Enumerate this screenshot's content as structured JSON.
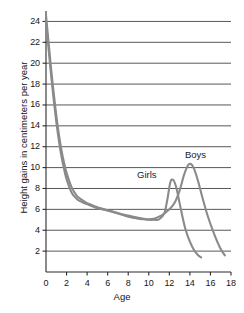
{
  "chart_data": {
    "type": "line",
    "title": "",
    "xlabel": "Age",
    "ylabel": "Height gains in centimeters per year",
    "xlim": [
      0,
      18
    ],
    "ylim": [
      0,
      25
    ],
    "xticks": [
      0,
      2,
      4,
      6,
      8,
      10,
      12,
      14,
      16,
      18
    ],
    "yticks": [
      2,
      4,
      6,
      8,
      10,
      12,
      14,
      16,
      18,
      20,
      22,
      24
    ],
    "grid": "horizontal",
    "legend_position": "inline-annotations",
    "annotations": [
      {
        "text": "Girls",
        "x": 10.6,
        "y": 9.4
      },
      {
        "text": "Boys",
        "x": 14.6,
        "y": 11.5
      }
    ],
    "series": [
      {
        "name": "Girls",
        "color": "#8a8a8a",
        "x": [
          0,
          0.25,
          0.5,
          0.75,
          1,
          1.25,
          1.5,
          1.75,
          2,
          2.5,
          3,
          3.5,
          4,
          4.5,
          5,
          5.5,
          6,
          6.5,
          7,
          7.5,
          8,
          8.5,
          9,
          9.5,
          10,
          10.5,
          11,
          11.5,
          11.8,
          12.1,
          12.4,
          12.7,
          13,
          13.3,
          13.6,
          14,
          14.4,
          14.8,
          15.1
        ],
        "y": [
          24.0,
          21.4,
          18.8,
          16.5,
          14.4,
          12.6,
          11.1,
          9.9,
          8.9,
          7.6,
          7.0,
          6.7,
          6.5,
          6.3,
          6.1,
          6.0,
          5.9,
          5.75,
          5.6,
          5.45,
          5.3,
          5.2,
          5.1,
          5.05,
          5.0,
          5.0,
          5.05,
          5.6,
          6.9,
          8.6,
          8.8,
          8.0,
          6.6,
          5.2,
          4.0,
          2.9,
          2.1,
          1.6,
          1.4
        ]
      },
      {
        "name": "Boys",
        "color": "#8a8a8a",
        "x": [
          0,
          0.25,
          0.5,
          0.75,
          1,
          1.25,
          1.5,
          1.75,
          2,
          2.5,
          3,
          3.5,
          4,
          4.5,
          5,
          5.5,
          6,
          6.5,
          7,
          7.5,
          8,
          8.5,
          9,
          9.5,
          10,
          10.5,
          11,
          11.5,
          12,
          12.5,
          13,
          13.4,
          13.8,
          14.1,
          14.4,
          14.8,
          15.2,
          15.6,
          16,
          16.5,
          17,
          17.4
        ],
        "y": [
          24.6,
          22.0,
          19.4,
          17.1,
          15.0,
          13.2,
          11.7,
          10.5,
          9.5,
          8.1,
          7.3,
          6.9,
          6.6,
          6.4,
          6.2,
          6.05,
          5.9,
          5.8,
          5.65,
          5.5,
          5.4,
          5.3,
          5.2,
          5.1,
          5.05,
          5.1,
          5.3,
          5.6,
          6.0,
          6.6,
          7.8,
          9.2,
          10.2,
          10.35,
          9.9,
          8.7,
          7.2,
          5.8,
          4.6,
          3.3,
          2.2,
          1.6
        ]
      }
    ]
  },
  "axes": {
    "y_title": "Height gains in centimeters per year",
    "x_title": "Age"
  }
}
